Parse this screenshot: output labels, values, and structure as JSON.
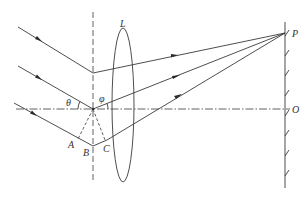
{
  "diagram": {
    "colors": {
      "line": "#3a3a3a",
      "background": "#ffffff"
    },
    "labels": {
      "lens": "L",
      "point_p": "P",
      "point_o": "O",
      "angle_theta": "θ",
      "angle_phi": "φ",
      "point_a": "A",
      "point_b": "B",
      "point_c": "C"
    },
    "elements": {
      "incident_rays": 3,
      "diffracted_rays": 3,
      "lens": "converging lens L",
      "screen": "observation screen with hatching",
      "optical_axis": "dash-dot line through O",
      "normal": "vertical dashed normal line"
    }
  }
}
